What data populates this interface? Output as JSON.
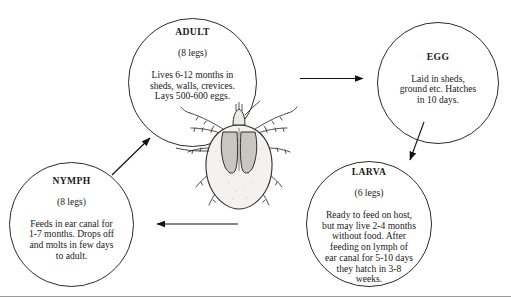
{
  "diagram": {
    "background_color": "#ffffff",
    "line_color": "#2b2b2b",
    "text_color": "#1a1a1a",
    "stages": [
      {
        "id": "adult",
        "title": "ADULT",
        "legs": "(8 legs)",
        "body": "Lives 6-12 months in\nsheds, walls, crevices.\nLays 500-600 eggs."
      },
      {
        "id": "egg",
        "title": "EGG",
        "legs": "",
        "body": "Laid in sheds,\nground etc. Hatches\nin 10 days."
      },
      {
        "id": "larva",
        "title": "LARVA",
        "legs": "(6 legs)",
        "body": "Ready to feed on host,\nbut may live 2-4 months\nwithout food. After\nfeeding on lymph of\near canal for 5-10 days\nthey hatch in 3-8\nweeks."
      },
      {
        "id": "nymph",
        "title": "NYMPH",
        "legs": "(8 legs)",
        "body": "Feeds in ear canal for\n1-7 months. Drops off\nand molts in few days\nto adult."
      }
    ],
    "arrows": [
      {
        "id": "adult-to-egg",
        "from": "adult",
        "to": "egg",
        "direction": "right"
      },
      {
        "id": "egg-to-larva",
        "from": "egg",
        "to": "larva",
        "direction": "down-left"
      },
      {
        "id": "larva-to-nymph",
        "from": "larva",
        "to": "nymph",
        "direction": "left"
      },
      {
        "id": "nymph-to-adult",
        "from": "nymph",
        "to": "adult",
        "direction": "up-right"
      }
    ],
    "illustration": {
      "name": "tick-illustration",
      "label": "tick"
    }
  }
}
